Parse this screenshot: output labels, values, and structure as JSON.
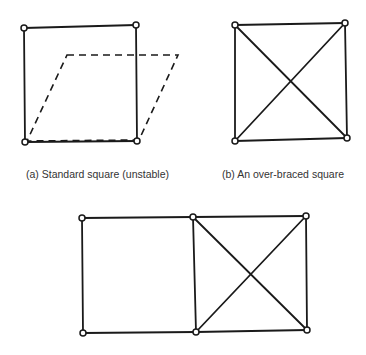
{
  "figures": {
    "a": {
      "caption": "(a) Standard square (unstable)",
      "joints": [
        [
          24,
          28
        ],
        [
          136,
          25
        ],
        [
          25,
          142
        ],
        [
          137,
          141
        ]
      ],
      "members": [
        [
          0,
          1
        ],
        [
          0,
          2
        ],
        [
          1,
          3
        ],
        [
          2,
          3
        ]
      ],
      "deformed_shape": [
        [
          67,
          55
        ],
        [
          178,
          55
        ],
        [
          139,
          140
        ],
        [
          27,
          141
        ]
      ]
    },
    "b": {
      "caption": "(b) An over-braced square",
      "joints": [
        [
          235,
          25
        ],
        [
          345,
          23
        ],
        [
          235,
          141
        ],
        [
          347,
          138
        ]
      ],
      "members": [
        [
          0,
          1
        ],
        [
          0,
          2
        ],
        [
          1,
          3
        ],
        [
          2,
          3
        ],
        [
          0,
          3
        ],
        [
          1,
          2
        ]
      ]
    },
    "c": {
      "caption": "",
      "joints": [
        [
          82,
          218
        ],
        [
          193,
          217
        ],
        [
          306,
          216
        ],
        [
          83,
          333
        ],
        [
          196,
          332
        ],
        [
          307,
          330
        ]
      ],
      "members": [
        [
          0,
          1
        ],
        [
          1,
          2
        ],
        [
          0,
          3
        ],
        [
          1,
          4
        ],
        [
          2,
          5
        ],
        [
          3,
          4
        ],
        [
          4,
          5
        ],
        [
          1,
          5
        ],
        [
          2,
          4
        ]
      ]
    }
  },
  "colors": {
    "line": "#1a1a1a",
    "joint_fill": "#ffffff",
    "caption": "#333333"
  }
}
